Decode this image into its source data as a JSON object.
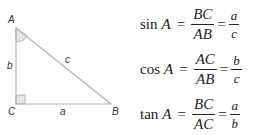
{
  "triangle": {
    "vertices": {
      "A": "A",
      "B": "B",
      "C": "C"
    },
    "sides": {
      "a": "a",
      "b": "b",
      "c": "c"
    },
    "right_angle_at": "C",
    "marked_angle": "A",
    "colors": {
      "line": "#b5b5b5",
      "angle_fill": "#e6e6e6",
      "label": "#333333"
    }
  },
  "formulas": [
    {
      "fn": "sin",
      "var": "A",
      "eq1": "=",
      "num1": "BC",
      "den1": "AB",
      "eq2": "=",
      "num2": "a",
      "den2": "c"
    },
    {
      "fn": "cos",
      "var": "A",
      "eq1": "=",
      "num1": "AC",
      "den1": "AB",
      "eq2": "=",
      "num2": "b",
      "den2": "c"
    },
    {
      "fn": "tan",
      "var": "A",
      "eq1": "=",
      "num1": "BC",
      "den1": "AC",
      "eq2": "=",
      "num2": "a",
      "den2": "b"
    }
  ]
}
